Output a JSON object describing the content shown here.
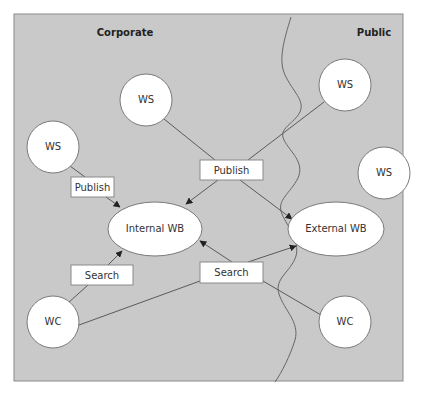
{
  "diagram": {
    "zones": {
      "left_title": "Corporate",
      "right_title": "Public"
    },
    "nodes": {
      "ws_top": "WS",
      "ws_left": "WS",
      "ws_top_right": "WS",
      "ws_right": "WS",
      "wc_left": "WC",
      "wc_right": "WC",
      "internal_wb": "Internal WB",
      "external_wb": "External WB"
    },
    "edge_labels": {
      "publish_left": "Publish",
      "publish_center": "Publish",
      "search_left": "Search",
      "search_center": "Search"
    },
    "colors": {
      "background": "#c9c9c9",
      "node_fill": "#ffffff",
      "line": "#5a5a5a"
    }
  }
}
